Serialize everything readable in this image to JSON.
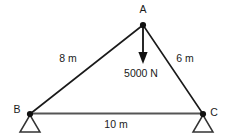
{
  "figure": {
    "background_color": "#ffffff",
    "member_color": "#1a1a1a",
    "chord_color": "#555555",
    "node_color": "#111111",
    "support_color": "#333333",
    "arrow_color": "#111111"
  },
  "nodes": [
    {
      "id": "A",
      "label": "A",
      "x": 143,
      "y": 25,
      "label_x": 143,
      "label_y": 13
    },
    {
      "id": "B",
      "label": "B",
      "x": 30,
      "y": 114,
      "label_x": 17,
      "label_y": 113
    },
    {
      "id": "C",
      "label": "C",
      "x": 203,
      "y": 114,
      "label_x": 214,
      "label_y": 115
    }
  ],
  "members": [
    {
      "id": "AB",
      "from": "A",
      "to": "B",
      "length_label": "8 m",
      "label_x": 68,
      "label_y": 62
    },
    {
      "id": "AC",
      "from": "A",
      "to": "C",
      "length_label": "6 m",
      "label_x": 184,
      "label_y": 62
    },
    {
      "id": "BC",
      "from": "B",
      "to": "C",
      "length_label": "10 m",
      "label_x": 116,
      "label_y": 128
    }
  ],
  "load": {
    "label": "5000 N",
    "label_x": 141,
    "label_y": 76,
    "direction": "down",
    "applied_at": "A",
    "arrow_start_y": 27,
    "arrow_end_y": 63
  },
  "supports": [
    {
      "at": "B",
      "type": "pin-triangle",
      "apex_x": 30,
      "apex_y": 115,
      "base_y": 132,
      "half_width": 10
    },
    {
      "at": "C",
      "type": "pin-triangle",
      "apex_x": 203,
      "apex_y": 115,
      "base_y": 132,
      "half_width": 10
    }
  ]
}
